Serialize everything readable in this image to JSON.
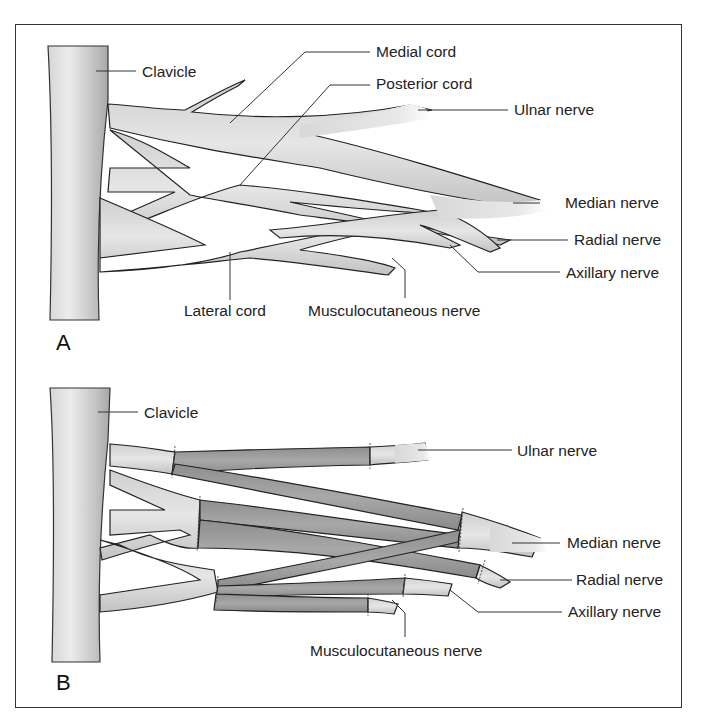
{
  "figure": {
    "panel_a": {
      "letter": "A",
      "labels": {
        "clavicle": "Clavicle",
        "medial_cord": "Medial cord",
        "posterior_cord": "Posterior cord",
        "ulnar_nerve": "Ulnar nerve",
        "median_nerve": "Median nerve",
        "radial_nerve": "Radial nerve",
        "axillary_nerve": "Axillary nerve",
        "lateral_cord": "Lateral cord",
        "musculocutaneous_nerve": "Musculocutaneous nerve"
      }
    },
    "panel_b": {
      "letter": "B",
      "labels": {
        "clavicle": "Clavicle",
        "ulnar_nerve": "Ulnar nerve",
        "median_nerve": "Median nerve",
        "radial_nerve": "Radial nerve",
        "axillary_nerve": "Axillary nerve",
        "musculocutaneous_nerve": "Musculocutaneous nerve"
      }
    },
    "colors": {
      "frame": "#333333",
      "nerve_light": "#e4e4e4",
      "nerve_mid": "#c8c8c8",
      "graft": "#9a9a9a",
      "outline": "#222222"
    }
  }
}
